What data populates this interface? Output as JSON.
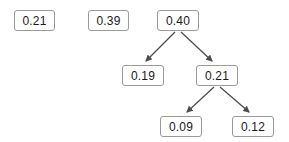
{
  "diagram": {
    "type": "tree",
    "background_color": "#ffffff",
    "node_border_color": "#9a9a9a",
    "node_fill_color": "#ffffff",
    "node_text_color": "#1a1a1a",
    "edge_color": "#4d4d4d",
    "nodes": [
      {
        "id": "n1",
        "label": "0.21",
        "x": 14,
        "y": 10,
        "w": 41,
        "h": 21
      },
      {
        "id": "n2",
        "label": "0.39",
        "x": 88,
        "y": 10,
        "w": 41,
        "h": 21
      },
      {
        "id": "n3",
        "label": "0.40",
        "x": 157,
        "y": 10,
        "w": 42,
        "h": 21
      },
      {
        "id": "n4",
        "label": "0.19",
        "x": 122,
        "y": 65,
        "w": 42,
        "h": 21
      },
      {
        "id": "n5",
        "label": "0.21",
        "x": 196,
        "y": 65,
        "w": 42,
        "h": 21
      },
      {
        "id": "n6",
        "label": "0.09",
        "x": 160,
        "y": 116,
        "w": 42,
        "h": 21
      },
      {
        "id": "n7",
        "label": "0.12",
        "x": 232,
        "y": 116,
        "w": 42,
        "h": 21
      }
    ],
    "edges": [
      {
        "id": "e1",
        "from": "n3",
        "to": "n4",
        "x1": 175,
        "y1": 32,
        "x2": 146,
        "y2": 61
      },
      {
        "id": "e2",
        "from": "n3",
        "to": "n5",
        "x1": 181,
        "y1": 32,
        "x2": 212,
        "y2": 61
      },
      {
        "id": "e3",
        "from": "n5",
        "to": "n6",
        "x1": 214,
        "y1": 87,
        "x2": 187,
        "y2": 112
      },
      {
        "id": "e4",
        "from": "n5",
        "to": "n7",
        "x1": 220,
        "y1": 87,
        "x2": 249,
        "y2": 112
      }
    ]
  }
}
